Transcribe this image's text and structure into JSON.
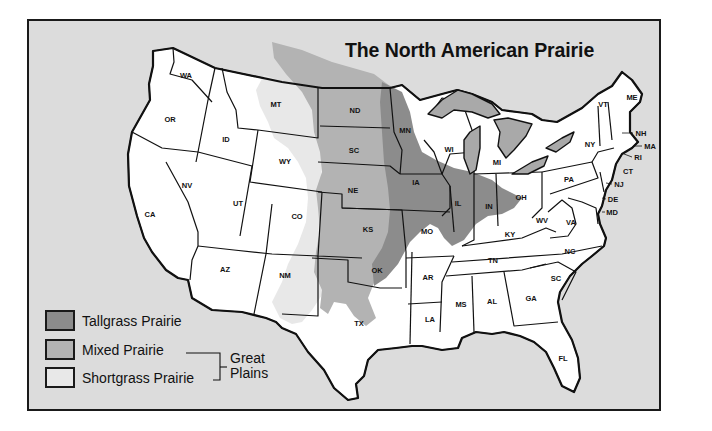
{
  "map": {
    "title": "The North American Prairie",
    "colors": {
      "background": "#dcdcdc",
      "tallgrass": "#8c8c8c",
      "mixed": "#b3b3b3",
      "shortgrass": "#e8e8e8",
      "states": "#ffffff",
      "lakes": "#a9a9a9",
      "outline": "#111111"
    },
    "legend": {
      "items": [
        {
          "label": "Tallgrass Prairie",
          "swatch": "tallgrass"
        },
        {
          "label": "Mixed Prairie",
          "swatch": "mixed"
        },
        {
          "label": "Shortgrass Prairie",
          "swatch": "shortgrass"
        }
      ],
      "bracket_label_line1": "Great",
      "bracket_label_line2": "Plains"
    },
    "states": {
      "WA": "WA",
      "OR": "OR",
      "CA": "CA",
      "ID": "ID",
      "NV": "NV",
      "MT": "MT",
      "WY": "WY",
      "UT": "UT",
      "CO": "CO",
      "AZ": "AZ",
      "NM": "NM",
      "ND": "ND",
      "SC_DAKOTA": "SC",
      "NE": "NE",
      "KS": "KS",
      "OK": "OK",
      "TX": "TX",
      "MN": "MN",
      "IA": "IA",
      "MO": "MO",
      "AR": "AR",
      "LA": "LA",
      "WI": "WI",
      "IL": "IL",
      "MI": "MI",
      "IN": "IN",
      "OH": "OH",
      "KY": "KY",
      "TN": "TN",
      "MS": "MS",
      "AL": "AL",
      "GA": "GA",
      "FL": "FL",
      "SC": "SC",
      "NC": "NC",
      "VA": "VA",
      "WV": "WV",
      "PA": "PA",
      "NY": "NY",
      "VT": "VT",
      "ME": "ME",
      "NH": "NH",
      "MA": "MA",
      "RI": "RI",
      "CT": "CT",
      "NJ": "NJ",
      "DE": "DE",
      "MD": "MD"
    }
  }
}
